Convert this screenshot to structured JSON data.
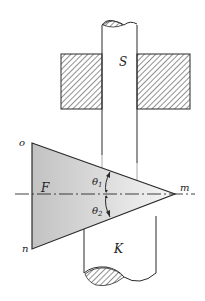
{
  "diagram": {
    "type": "optics-prism-rods",
    "labels": {
      "upper_rod": "S",
      "lower_rod": "K",
      "prism_left_field": "F",
      "vertex_top": "o",
      "vertex_bottom": "n",
      "apex": "m",
      "angle_upper": "θ",
      "angle_upper_sub": "1",
      "angle_lower": "θ",
      "angle_lower_sub": "2"
    },
    "colors": {
      "stroke": "#2a2a2a",
      "prism_fill_dark": "#bdbdbd",
      "prism_fill_light": "#f4f4f4",
      "hatch": "#555555",
      "background": "#ffffff"
    }
  }
}
